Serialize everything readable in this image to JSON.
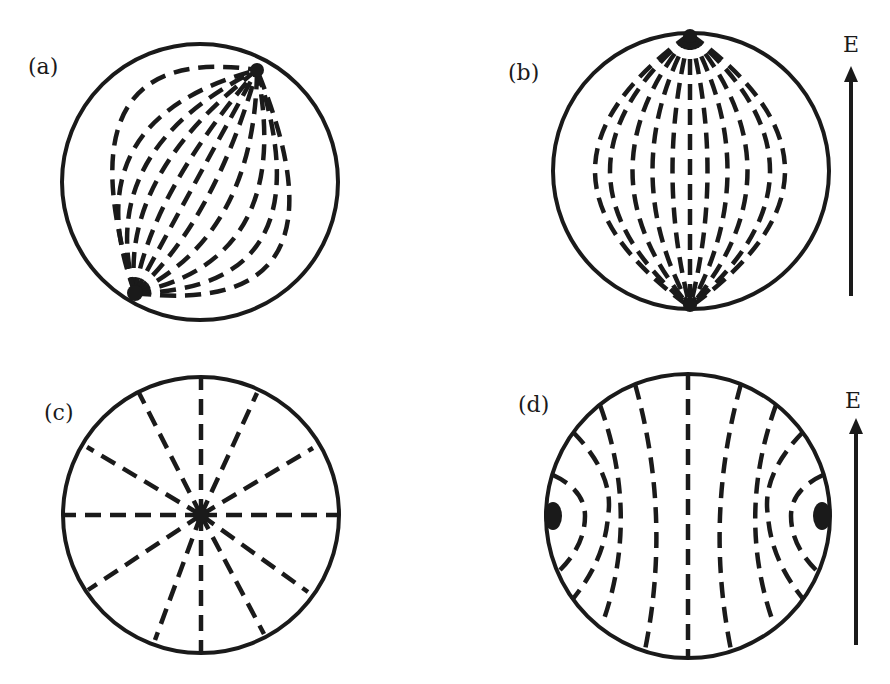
{
  "figure": {
    "panels": [
      {
        "id": "a",
        "label": "(a)",
        "description": "Sphere with field lines converging at two tilted poles",
        "center": [
          200,
          182
        ],
        "radius": 138,
        "poles": [
          [
            257,
            70
          ],
          [
            135,
            293
          ]
        ]
      },
      {
        "id": "b",
        "label": "(b)",
        "description": "Sphere with field lines converging at top and bottom poles aligned with E",
        "center": [
          691,
          171
        ],
        "radius": 138,
        "poles": [
          [
            690,
            34
          ],
          [
            690,
            307
          ]
        ],
        "field_label": "E"
      },
      {
        "id": "c",
        "label": "(c)",
        "description": "Circle with radial dashed lines from central point defect",
        "center": [
          201,
          515
        ],
        "radius": 138,
        "radial_lines": 12
      },
      {
        "id": "d",
        "label": "(d)",
        "description": "Circle with two surface point defects on left and right, lines bending around them",
        "center": [
          688,
          516
        ],
        "radius": 142,
        "defects": [
          [
            553,
            516
          ],
          [
            822,
            516
          ]
        ],
        "field_label": "E"
      }
    ],
    "colors": {
      "ink": "#1a1a1a",
      "background": "#ffffff"
    }
  }
}
